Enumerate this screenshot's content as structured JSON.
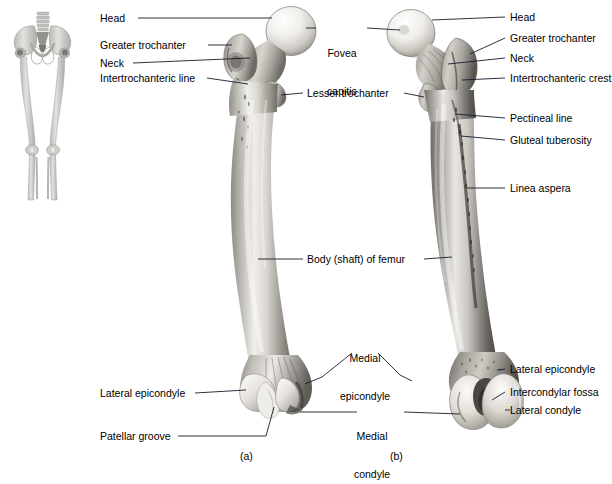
{
  "figure": {
    "panels": [
      {
        "id": "a",
        "caption": "(a)",
        "view": "anterior"
      },
      {
        "id": "b",
        "caption": "(b)",
        "view": "posterior"
      }
    ],
    "orientation_inset": "skeleton-lower-limbs"
  },
  "labels": {
    "left_column": [
      {
        "name": "head",
        "text": "Head"
      },
      {
        "name": "greater-trochanter",
        "text": "Greater trochanter"
      },
      {
        "name": "neck",
        "text": "Neck"
      },
      {
        "name": "intertrochanteric-line",
        "text": "Intertrochanteric line"
      },
      {
        "name": "lateral-epicondyle-a",
        "text": "Lateral epicondyle"
      },
      {
        "name": "patellar-groove",
        "text": "Patellar groove"
      }
    ],
    "center_column": [
      {
        "name": "fovea-capitis",
        "line1": "Fovea",
        "line2": "capitis"
      },
      {
        "name": "lesser-trochanter",
        "text": "Lesser trochanter"
      },
      {
        "name": "body-shaft-of-femur",
        "text": "Body (shaft) of femur"
      },
      {
        "name": "medial-epicondyle",
        "line1": "Medial",
        "line2": "epicondyle"
      },
      {
        "name": "medial-condyle",
        "line1": "Medial",
        "line2": "condyle"
      }
    ],
    "right_column": [
      {
        "name": "head-b",
        "text": "Head"
      },
      {
        "name": "greater-trochanter-b",
        "text": "Greater trochanter"
      },
      {
        "name": "neck-b",
        "text": "Neck"
      },
      {
        "name": "intertrochanteric-crest",
        "text": "Intertrochanteric crest"
      },
      {
        "name": "pectineal-line",
        "text": "Pectineal line"
      },
      {
        "name": "gluteal-tuberosity",
        "text": "Gluteal tuberosity"
      },
      {
        "name": "linea-aspera",
        "text": "Linea aspera"
      },
      {
        "name": "lateral-epicondyle-b",
        "text": "Lateral epicondyle"
      },
      {
        "name": "intercondylar-fossa",
        "text": "Intercondylar fossa"
      },
      {
        "name": "lateral-condyle",
        "text": "Lateral condyle"
      }
    ]
  },
  "colors": {
    "background": "#ffffff",
    "label_text": "#000000",
    "leader_line": "#1a1a2e",
    "bone_light": "#f2f0ec",
    "bone_mid": "#b9b6b0",
    "bone_dark": "#6e6b66",
    "bone_shadow": "#45433f",
    "inset_bone": "#c9c7c3"
  }
}
